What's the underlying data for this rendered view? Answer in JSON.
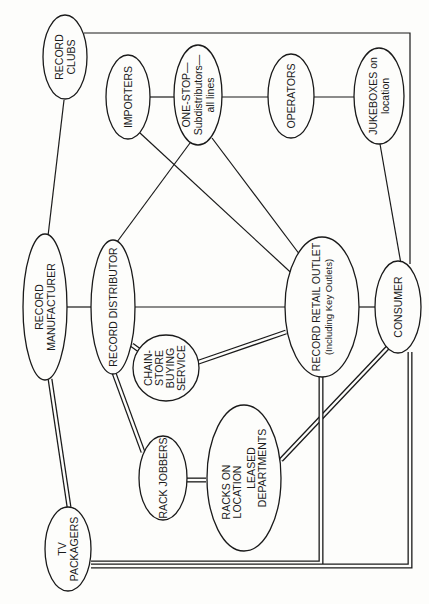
{
  "diagram": {
    "orientation": "rotated-90-ccw",
    "nodes": {
      "record_clubs": {
        "lines": [
          "RECORD",
          "CLUBS"
        ]
      },
      "importers": {
        "lines": [
          "IMPORTERS"
        ]
      },
      "one_stop": {
        "lines": [
          "ONE-STOP—",
          "Subdistributors—",
          "all lines"
        ]
      },
      "operators": {
        "lines": [
          "OPERATORS"
        ]
      },
      "jukeboxes": {
        "lines": [
          "JUKEBOXES on",
          "location"
        ]
      },
      "record_manufacturer": {
        "lines": [
          "RECORD",
          "MANUFACTURER"
        ]
      },
      "record_distributor": {
        "lines": [
          "RECORD DISTRIBUTOR"
        ]
      },
      "chain_store": {
        "lines": [
          "CHAIN-",
          "STORE",
          "BUYING",
          "SERVICE"
        ]
      },
      "record_retail_outlet": {
        "lines": [
          "RECORD RETAIL OUTLET",
          "(Including Key Outlets)"
        ]
      },
      "consumer": {
        "lines": [
          "CONSUMER"
        ]
      },
      "rack_jobbers": {
        "lines": [
          "RACK JOBBERS"
        ]
      },
      "racks_on_location": {
        "lines": [
          "RACKS ON",
          "LOCATION",
          "LEASED",
          "DEPARTMENTS"
        ]
      },
      "tv_packagers": {
        "lines": [
          "TV",
          "PACKAGERS"
        ]
      }
    },
    "edges": [
      {
        "from": "record_clubs",
        "to": "consumer",
        "style": "single"
      },
      {
        "from": "record_clubs",
        "to": "record_manufacturer",
        "style": "single"
      },
      {
        "from": "importers",
        "to": "one_stop",
        "style": "single"
      },
      {
        "from": "importers",
        "to": "record_retail_outlet",
        "style": "single"
      },
      {
        "from": "one_stop",
        "to": "operators",
        "style": "single"
      },
      {
        "from": "one_stop",
        "to": "record_distributor",
        "style": "single"
      },
      {
        "from": "one_stop",
        "to": "record_retail_outlet",
        "style": "single"
      },
      {
        "from": "operators",
        "to": "jukeboxes",
        "style": "single"
      },
      {
        "from": "jukeboxes",
        "to": "consumer",
        "style": "single"
      },
      {
        "from": "record_manufacturer",
        "to": "record_distributor",
        "style": "single"
      },
      {
        "from": "record_manufacturer",
        "to": "tv_packagers",
        "style": "double"
      },
      {
        "from": "record_distributor",
        "to": "record_retail_outlet",
        "style": "single"
      },
      {
        "from": "record_distributor",
        "to": "chain_store",
        "style": "double"
      },
      {
        "from": "record_distributor",
        "to": "rack_jobbers",
        "style": "double"
      },
      {
        "from": "chain_store",
        "to": "record_retail_outlet",
        "style": "double"
      },
      {
        "from": "record_retail_outlet",
        "to": "consumer",
        "style": "single"
      },
      {
        "from": "record_retail_outlet",
        "to": "tv_packagers",
        "style": "double"
      },
      {
        "from": "rack_jobbers",
        "to": "racks_on_location",
        "style": "double"
      },
      {
        "from": "racks_on_location",
        "to": "consumer",
        "style": "double"
      },
      {
        "from": "tv_packagers",
        "to": "consumer",
        "style": "double"
      }
    ]
  }
}
